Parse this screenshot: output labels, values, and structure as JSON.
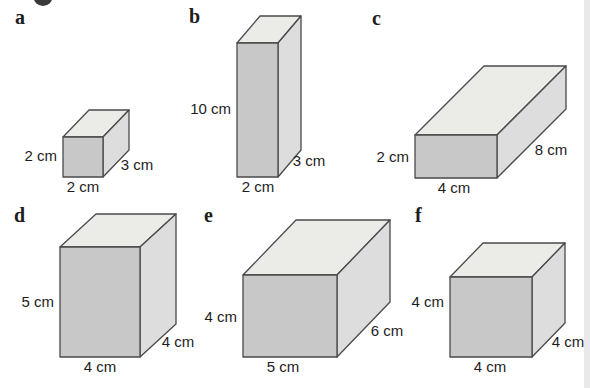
{
  "palette": {
    "background": "#ffffff",
    "face_front": "#c8c8c8",
    "face_side": "#dddddd",
    "face_top": "#ebebe8",
    "outline": "#4a4a4a",
    "text": "#1d1d1d",
    "badge": "#3a3a3a",
    "page_edge_stripe": "#e9e9e9"
  },
  "figure": {
    "solids": [
      {
        "letter": "a",
        "height_label": "2 cm",
        "width_label": "2 cm",
        "depth_label": "3 cm"
      },
      {
        "letter": "b",
        "height_label": "10 cm",
        "width_label": "2 cm",
        "depth_label": "3 cm"
      },
      {
        "letter": "c",
        "height_label": "2 cm",
        "width_label": "4 cm",
        "depth_label": "8 cm"
      },
      {
        "letter": "d",
        "height_label": "5 cm",
        "width_label": "4 cm",
        "depth_label": "4 cm"
      },
      {
        "letter": "e",
        "height_label": "4 cm",
        "width_label": "5 cm",
        "depth_label": "6 cm"
      },
      {
        "letter": "f",
        "height_label": "4 cm",
        "width_label": "4 cm",
        "depth_label": "4 cm"
      }
    ]
  }
}
